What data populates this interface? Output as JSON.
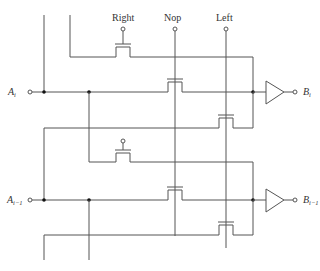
{
  "diagram": {
    "title": "",
    "control_signals": [
      {
        "id": "right",
        "label": "Right"
      },
      {
        "id": "nop",
        "label": "Nop"
      },
      {
        "id": "left",
        "label": "Left"
      }
    ],
    "inputs": [
      {
        "id": "a_i",
        "base": "A",
        "sub": "i"
      },
      {
        "id": "a_i_minus_1",
        "base": "A",
        "sub": "i−1"
      }
    ],
    "outputs": [
      {
        "id": "b_i",
        "base": "B",
        "sub": "i"
      },
      {
        "id": "b_i_minus_1",
        "base": "B",
        "sub": "i−1"
      }
    ],
    "colors": {
      "wire": "#555555",
      "junction": "#111111",
      "text": "#333333",
      "background": "#ffffff"
    }
  }
}
